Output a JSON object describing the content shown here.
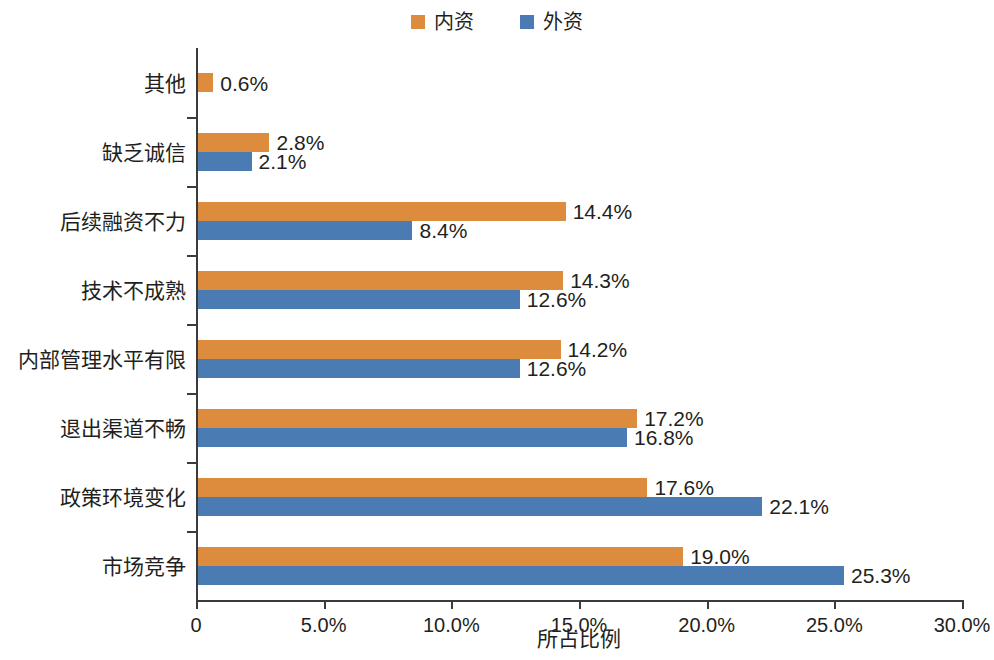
{
  "chart_data": {
    "type": "bar",
    "orientation": "horizontal",
    "title": "",
    "xlabel": "所占比例",
    "ylabel": "",
    "xlim": [
      0,
      30
    ],
    "xticks": [
      0,
      5,
      10,
      15,
      20,
      25,
      30
    ],
    "xtick_labels": [
      "0",
      "5.0%",
      "10.0%",
      "15.0%",
      "20.0%",
      "25.0%",
      "30.0%"
    ],
    "grid": false,
    "legend_position": "top-center",
    "categories": [
      "其他",
      "缺乏诚信",
      "后续融资不力",
      "技术不成熟",
      "内部管理水平有限",
      "退出渠道不畅",
      "政策环境变化",
      "市场竞争"
    ],
    "series": [
      {
        "name": "内资",
        "color": "#dd8b3d",
        "values": [
          0.6,
          2.8,
          14.4,
          14.3,
          14.2,
          17.2,
          17.6,
          19.0
        ],
        "labels": [
          "0.6%",
          "2.8%",
          "14.4%",
          "14.3%",
          "14.2%",
          "17.2%",
          "17.6%",
          "19.0%"
        ]
      },
      {
        "name": "外资",
        "color": "#4a7cb3",
        "values": [
          null,
          2.1,
          8.4,
          12.6,
          12.6,
          16.8,
          22.1,
          25.3
        ],
        "labels": [
          null,
          "2.1%",
          "8.4%",
          "12.6%",
          "12.6%",
          "16.8%",
          "22.1%",
          "25.3%"
        ]
      }
    ]
  },
  "legend": {
    "entries": [
      {
        "label": "内资",
        "color": "#dd8b3d",
        "swatch": "legend-swatch-inner"
      },
      {
        "label": "外资",
        "color": "#4a7cb3",
        "swatch": "legend-swatch-outer"
      }
    ]
  },
  "axis": {
    "x_title": "所占比例"
  }
}
